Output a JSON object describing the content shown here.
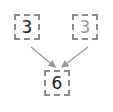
{
  "diagram": {
    "type": "addition-tree",
    "nodes": [
      {
        "id": "left-addend",
        "value": "3",
        "color": "#1a1a1a"
      },
      {
        "id": "right-addend",
        "value": "3",
        "color": "#9a9a9a"
      },
      {
        "id": "sum",
        "value": "6",
        "color": "#1a1a1a"
      }
    ],
    "edges": [
      {
        "from": "left-addend",
        "to": "sum"
      },
      {
        "from": "right-addend",
        "to": "sum"
      }
    ],
    "border_color": "#8a8a8a",
    "arrow_color": "#999999"
  }
}
